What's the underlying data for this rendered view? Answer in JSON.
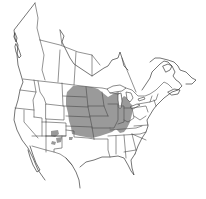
{
  "map": {
    "type": "species-range-map",
    "region": "North America (Canada, United States, northern Mexico)",
    "projection_hint": "conic",
    "colors": {
      "background": "#ffffff",
      "outline": "#3a3a3a",
      "range_fill": "#9a9a9a"
    },
    "range": {
      "description": "Main range over central US Great Plains / Midwest, plus scattered patches in New Mexico",
      "core_states": [
        "North Dakota",
        "South Dakota",
        "Nebraska",
        "Kansas",
        "Oklahoma",
        "Minnesota",
        "Iowa",
        "Missouri",
        "Illinois",
        "Indiana",
        "Wisconsin",
        "Michigan"
      ],
      "disjunct_areas": [
        "New Mexico",
        "Southern Manitoba/Ontario border"
      ]
    },
    "labels": []
  }
}
